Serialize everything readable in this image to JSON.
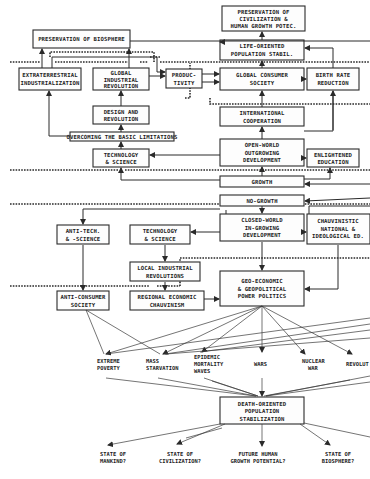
{
  "diagram": {
    "type": "flowchart",
    "nodes": {
      "preservation_biosphere": "PRESERVATION OF BIOSPHERE",
      "preservation_civilization": [
        "PRESERVATION OF",
        "CIVILIZATION &",
        "HUMAN GROWTH POTEC."
      ],
      "extraterrestrial": [
        "EXTRATERRESTRIAL",
        "INDUSTRIALIZATION"
      ],
      "global_industrial": [
        "GLOBAL",
        "INDUSTRIAL",
        "REVOLUTION"
      ],
      "productivity": [
        "PRODUC-",
        "TIVITY"
      ],
      "life_oriented": [
        "LIFE-ORIENTED",
        "POPULATION STABIL."
      ],
      "global_consumer": [
        "GLOBAL CONSUMER",
        "SOCIETY"
      ],
      "birth_rate": [
        "BIRTH RATE",
        "REDUCTION"
      ],
      "design_revolution": [
        "DESIGN AND",
        "REVOLUTION"
      ],
      "overcoming": "OVERCOMING THE BASIC LIMITATIONS",
      "international": [
        "INTERNATIONAL",
        "COOPERATION"
      ],
      "tech_science_top": [
        "TECHNOLOGY",
        "& SCIENCE"
      ],
      "open_world": [
        "OPEN-WORLD",
        "OUTGROWING",
        "DEVELOPMENT"
      ],
      "enlightened": [
        "ENLIGHTENED",
        "EDUCATION"
      ],
      "growth": "GROWTH",
      "no_growth": "NO-GROWTH",
      "anti_tech": [
        "ANTI-TECH.",
        "& -SCIENCE"
      ],
      "tech_science_bottom": [
        "TECHNOLOGY",
        "& SCIENCE"
      ],
      "closed_world": [
        "CLOSED-WORLD",
        "IN-GROWING",
        "DEVELOPMENT"
      ],
      "chauvinistic": [
        "CHAUVINISTIC",
        "NATIONAL &",
        "IDEOLOGICAL ED."
      ],
      "local_industrial": [
        "LOCAL INDUSTRIAL",
        "REVOLUTIONS"
      ],
      "anti_consumer": [
        "ANTI-CONSUMER",
        "SOCIETY"
      ],
      "regional_economic": [
        "REGIONAL ECONOMIC",
        "CHAUVINISM"
      ],
      "geo_economic": [
        "GEO-ECONOMIC",
        "& GEOPOLITICAL",
        "POWER POLITICS"
      ],
      "death_oriented": [
        "DEATH-ORIENTED",
        "POPULATION",
        "STABILIZATION"
      ]
    },
    "outcomes": [
      [
        "EXTREME",
        "POVERTY"
      ],
      [
        "MASS",
        "STARVATION"
      ],
      [
        "EPIDEMIC",
        "MORTALITY",
        "WAVES"
      ],
      [
        "WARS"
      ],
      [
        "NUCLEAR",
        "WAR"
      ],
      [
        "REVOLUT"
      ]
    ],
    "final_states": [
      [
        "STATE OF",
        "MANKIND?"
      ],
      [
        "STATE OF",
        "CIVILIZATION?"
      ],
      [
        "FUTURE HUMAN",
        "GROWTH POTENTIAL?"
      ],
      [
        "STATE OF",
        "BIOSPHERE?"
      ]
    ]
  }
}
